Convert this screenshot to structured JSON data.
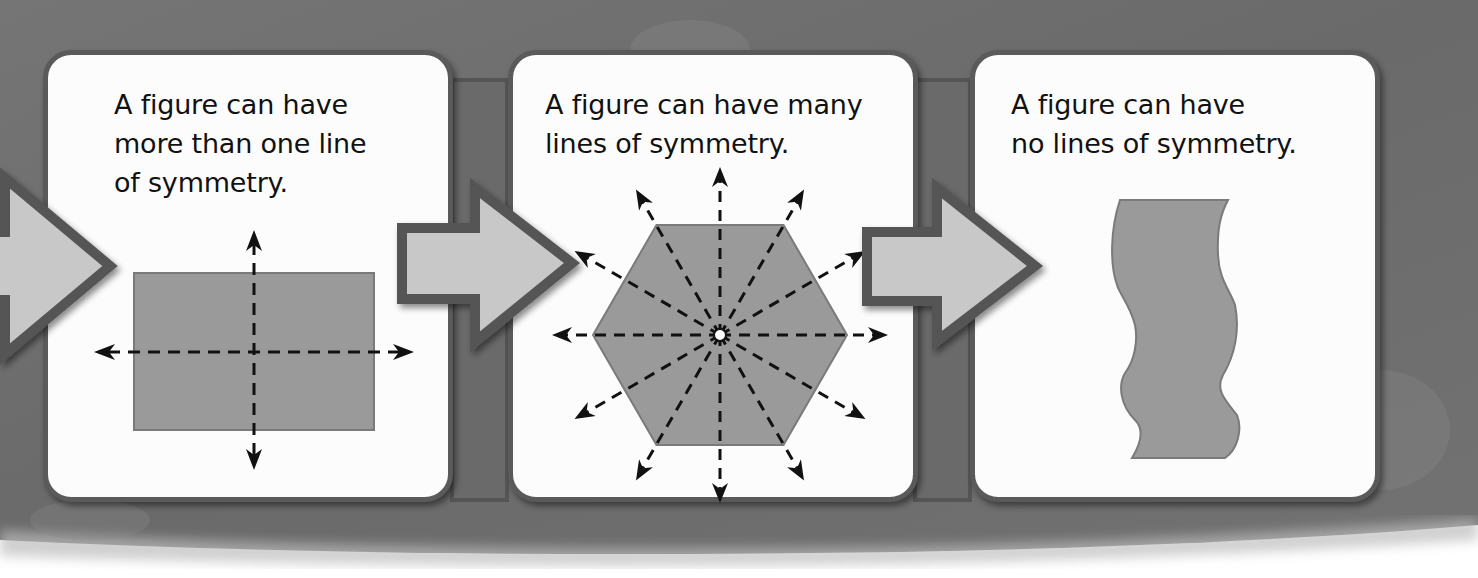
{
  "diagram": {
    "topic": "Lines of symmetry",
    "panels": [
      {
        "caption": "A figure can have\nmore than one line\nof symmetry.",
        "figure": "rectangle",
        "lines_of_symmetry": 2
      },
      {
        "caption": "A figure can have many\nlines of symmetry.",
        "figure": "regular-hexagon",
        "lines_of_symmetry": 6
      },
      {
        "caption": "A figure can have\nno lines of symmetry.",
        "figure": "irregular-wavy-shape",
        "lines_of_symmetry": 0
      }
    ],
    "flow_arrows": 3,
    "colors": {
      "background": "#6e6e6e",
      "card_fill": "#fcfcfc",
      "card_border": "#5a5a5a",
      "shape_fill": "#9a9a9a",
      "shape_stroke": "#7a7a7a",
      "flow_arrow_fill": "#c8c8c8",
      "flow_arrow_border": "#555555",
      "line_color": "#111111"
    }
  }
}
